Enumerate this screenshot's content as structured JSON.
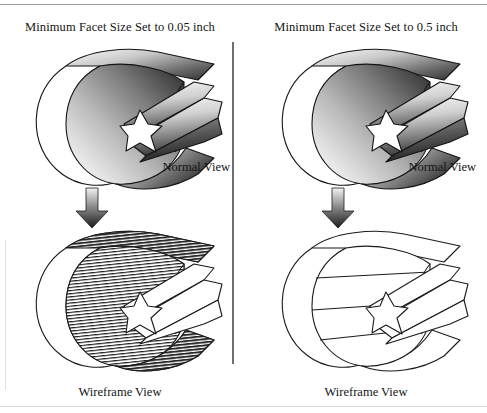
{
  "figure": {
    "caption_type": "cad-faceting-comparison",
    "background_color": "#ffffff",
    "line_color": "#1a1a1a",
    "rule_color": "#9a9a9a",
    "divider_color": "#6f6f6f"
  },
  "panels": [
    {
      "id": "left",
      "title": "Minimum Facet Size Set to 0.05 inch",
      "facet_size": "0.05 inch",
      "normal_label": "Normal View",
      "wireframe_label": "Wireframe View",
      "tessellation": "fine",
      "facet_line_count": 46,
      "arrow": "down-arrow-icon"
    },
    {
      "id": "right",
      "title": "Minimum Facet Size Set to 0.5 inch",
      "facet_size": "0.5 inch",
      "normal_label": "Normal View",
      "wireframe_label": "Wireframe View",
      "tessellation": "coarse",
      "facet_line_count": 4,
      "arrow": "down-arrow-icon"
    }
  ],
  "model": {
    "name": "cylindrical-shell-with-star-extrusion",
    "shading": "grayscale-gradient",
    "gradient_light": "#fdfdfd",
    "gradient_dark": "#2b2b2b"
  }
}
